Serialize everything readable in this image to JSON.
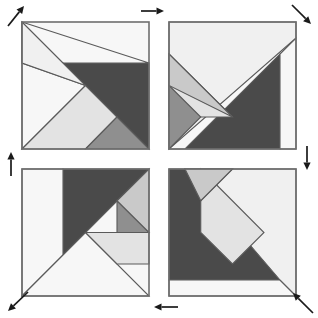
{
  "figure": {
    "background_color": "#ffffff",
    "canvas": {
      "width": 318,
      "height": 318
    }
  },
  "palette": {
    "dark": "#4a4a4a",
    "mid": "#8f8f8f",
    "light": "#c9c9c9",
    "pale": "#e3e3e3",
    "near_white": "#f0f0f0",
    "white": "#f7f7f7",
    "outline": "#5a5a5a",
    "frame": "#6e6e6e",
    "arrow": "#1a1a1a"
  },
  "grid": {
    "rows": 2,
    "cols": 2,
    "gap_px": 14,
    "square_size_px": 127,
    "origin": {
      "x": 22,
      "y": 22
    }
  },
  "squares": [
    {
      "id": "square-top-left",
      "label": "Top Left Tangram Square",
      "position": {
        "row": 0,
        "col": 0,
        "x": 22,
        "y": 22,
        "size": 127
      },
      "pieces": [
        {
          "name": "large-triangle-dark",
          "shade": "dark",
          "points": "0,41 127,41 127,127 63.5,63.5"
        },
        {
          "name": "large-triangle-white",
          "shade": "white",
          "points": "0,0 0,127 63.5,63.5 0,41"
        },
        {
          "name": "big-white-upper",
          "shade": "white",
          "points": "0,0 127,41 0,41"
        },
        {
          "name": "medium-triangle-pale",
          "shade": "pale",
          "points": "0,127 63.5,63.5 95,95 63.5,127"
        },
        {
          "name": "small-triangle-mid",
          "shade": "mid",
          "points": "63.5,127 95,95 127,127"
        },
        {
          "name": "upper-white-fill",
          "shade": "near_white",
          "points": "0,0 63.5,63.5 0,41"
        }
      ]
    },
    {
      "id": "square-top-right",
      "label": "Top Right Tangram Square",
      "position": {
        "row": 0,
        "col": 1,
        "x": 169,
        "y": 22,
        "size": 127
      },
      "pieces": [
        {
          "name": "large-triangle-dark",
          "shade": "dark",
          "points": "0,127 111,127 111,32 16,127"
        },
        {
          "name": "right-strip-white",
          "shade": "white",
          "points": "111,32 127,16 127,127 111,127"
        },
        {
          "name": "upper-white-body",
          "shade": "near_white",
          "points": "0,0 127,0 127,16 0,127 0,0"
        },
        {
          "name": "medium-triangle-pale",
          "shade": "pale",
          "points": "0,32 63.5,95 0,95"
        },
        {
          "name": "small-triangle-mid",
          "shade": "mid",
          "points": "0,63.5 31.75,95 0,127"
        },
        {
          "name": "inner-light",
          "shade": "light",
          "points": "0,32 63.5,95 0,63.5"
        }
      ]
    },
    {
      "id": "square-bottom-left",
      "label": "Bottom Left Tangram Square",
      "position": {
        "row": 1,
        "col": 0,
        "x": 22,
        "y": 169,
        "size": 127
      },
      "pieces": [
        {
          "name": "large-triangle-dark",
          "shade": "dark",
          "points": "41,0 127,0 63.5,63.5 41,86"
        },
        {
          "name": "left-strip-white",
          "shade": "white",
          "points": "0,0 41,0 41,86 0,127"
        },
        {
          "name": "bottom-white-body",
          "shade": "white",
          "points": "0,127 63.5,63.5 127,127"
        },
        {
          "name": "medium-triangle-pale",
          "shade": "pale",
          "points": "63.5,63.5 127,63.5 127,95 95,95"
        },
        {
          "name": "small-triangle-mid",
          "shade": "mid",
          "points": "95,31.75 127,63.5 95,63.5"
        },
        {
          "name": "right-light",
          "shade": "light",
          "points": "95,31.75 127,0 127,63.5"
        }
      ]
    },
    {
      "id": "square-bottom-right",
      "label": "Bottom Right Tangram Square",
      "position": {
        "row": 1,
        "col": 1,
        "x": 169,
        "y": 169,
        "size": 127
      },
      "pieces": [
        {
          "name": "large-triangle-dark",
          "shade": "dark",
          "points": "0,0 0,111 111,111 16,0"
        },
        {
          "name": "bottom-strip-white",
          "shade": "white",
          "points": "0,111 0,127 127,127 111,111"
        },
        {
          "name": "right-white-body",
          "shade": "near_white",
          "points": "127,0 127,127 111,111 16,0"
        },
        {
          "name": "medium-triangle-pale",
          "shade": "pale",
          "points": "31.75,0 95,63.5 63.5,95 31.75,63.5"
        },
        {
          "name": "small-triangle-mid",
          "shade": "mid",
          "points": "16,0 63.5,0 31.75,31.75"
        },
        {
          "name": "upper-light",
          "shade": "light",
          "points": "16,0 63.5,0 31.75,31.75"
        }
      ]
    }
  ],
  "arrows": [
    {
      "id": "arrow-top-left",
      "label": "Top left diagonal arrow pointing up-left (outward)",
      "direction": "up-left",
      "x1": 8,
      "y1": 26,
      "x2": 24,
      "y2": 6
    },
    {
      "id": "arrow-top-center",
      "label": "Top center arrow pointing right",
      "direction": "right",
      "x1": 141,
      "y1": 11,
      "x2": 164,
      "y2": 11
    },
    {
      "id": "arrow-top-right",
      "label": "Top right diagonal arrow pointing down-right",
      "direction": "down-right",
      "x1": 292,
      "y1": 5,
      "x2": 311,
      "y2": 24
    },
    {
      "id": "arrow-left-middle",
      "label": "Left middle arrow pointing up",
      "direction": "up",
      "x1": 11,
      "y1": 176,
      "x2": 11,
      "y2": 152
    },
    {
      "id": "arrow-right-middle",
      "label": "Right middle arrow pointing down",
      "direction": "down",
      "x1": 307,
      "y1": 146,
      "x2": 307,
      "y2": 170
    },
    {
      "id": "arrow-bottom-left",
      "label": "Bottom left diagonal arrow pointing down-left",
      "direction": "down-left",
      "x1": 28,
      "y1": 292,
      "x2": 8,
      "y2": 311
    },
    {
      "id": "arrow-bottom-center",
      "label": "Bottom center arrow pointing left",
      "direction": "left",
      "x1": 178,
      "y1": 307,
      "x2": 154,
      "y2": 307
    },
    {
      "id": "arrow-bottom-right",
      "label": "Bottom right diagonal arrow pointing up-left (inward)",
      "direction": "up-left",
      "x1": 313,
      "y1": 313,
      "x2": 293,
      "y2": 293
    }
  ]
}
